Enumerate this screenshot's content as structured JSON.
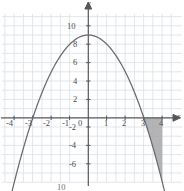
{
  "figure": {
    "name": "parabola-graph-with-shaded-region",
    "background_color": "#ffffff",
    "grid_color": "#d9dfe6",
    "axis_color": "#55565a",
    "curve_color": "#6a6a6e",
    "shade_fill": "#a7a7a9",
    "shade_stroke": "#6a6a6e",
    "axis_labels": {
      "x": "x",
      "y": "y"
    },
    "bottom_partial_label": "10"
  },
  "chart_data": {
    "type": "line",
    "title": "",
    "xlabel": "x",
    "ylabel": "y",
    "function": "y = 9 - x^2",
    "xlim": [
      -4.6,
      4.6
    ],
    "ylim": [
      -7.6,
      11.2
    ],
    "grid": true,
    "legend": null,
    "x_ticks": [
      -4,
      -3,
      -2,
      -1,
      0,
      1,
      2,
      3,
      4
    ],
    "x_tick_labels": [
      "-4",
      "-3",
      "-2",
      "-1",
      "0",
      "1",
      "2",
      "3",
      "4"
    ],
    "y_ticks": [
      10,
      8,
      6,
      4,
      2,
      0,
      -2,
      -4,
      -6
    ],
    "y_tick_labels": [
      "10",
      "8",
      "6",
      "4",
      "2",
      "0",
      "-2",
      "-4",
      "-6"
    ],
    "x_gridline_values": [
      -4,
      -3,
      -2,
      -1,
      0,
      1,
      2,
      3,
      4
    ],
    "y_gridline_values": [
      10,
      8,
      6,
      4,
      2,
      0,
      -2,
      -4,
      -6
    ],
    "vertex": [
      0,
      9
    ],
    "roots": [
      -3,
      3
    ],
    "series": [
      {
        "name": "y = 9 - x^2",
        "x": [
          -4.3,
          -4.0,
          -3.5,
          -3.0,
          -2.5,
          -2.0,
          -1.5,
          -1.0,
          -0.5,
          0.0,
          0.5,
          1.0,
          1.5,
          2.0,
          2.5,
          3.0,
          3.5,
          4.0,
          4.1
        ],
        "values": [
          -9.49,
          -7.0,
          -3.25,
          0.0,
          2.75,
          5.0,
          6.75,
          8.0,
          8.75,
          9.0,
          8.75,
          8.0,
          6.75,
          5.0,
          2.75,
          0.0,
          -3.25,
          -7.0,
          -7.81
        ]
      }
    ],
    "shaded_region": {
      "label": "region between curve and x-axis from x=3 to x=4",
      "x_start": 3,
      "x_end": 4,
      "y_upper": 0,
      "y_lower_function": "9 - x^2",
      "fill_color": "#a7a7a9"
    }
  },
  "ticks": {
    "x": [
      {
        "label": "-4",
        "left": 6,
        "top": 119
      },
      {
        "label": "-3",
        "left": 25,
        "top": 119
      },
      {
        "label": "-2",
        "left": 43,
        "top": 119
      },
      {
        "label": "-1",
        "left": 62,
        "top": 119
      },
      {
        "label": "0",
        "left": 75,
        "top": 119
      },
      {
        "label": "1",
        "left": 97,
        "top": 119
      },
      {
        "label": "2",
        "left": 115,
        "top": 119
      },
      {
        "label": "3",
        "left": 134,
        "top": 119
      },
      {
        "label": "4",
        "left": 152,
        "top": 119
      }
    ],
    "y": [
      {
        "label": "10",
        "left": 67,
        "top": 23
      },
      {
        "label": "8",
        "left": 71,
        "top": 41
      },
      {
        "label": "6",
        "left": 71,
        "top": 59
      },
      {
        "label": "4",
        "left": 71,
        "top": 78
      },
      {
        "label": "2",
        "left": 71,
        "top": 96
      },
      {
        "label": "-2",
        "left": 68,
        "top": 124
      },
      {
        "label": "-4",
        "left": 68,
        "top": 142
      },
      {
        "label": "-6",
        "left": 68,
        "top": 161
      }
    ]
  }
}
